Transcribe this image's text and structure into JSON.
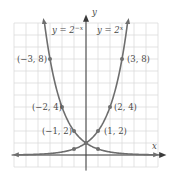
{
  "chart_data": {
    "type": "line",
    "title": "",
    "xlabel": "x",
    "ylabel": "y",
    "xlim": [
      -6,
      6
    ],
    "ylim": [
      -1,
      11
    ],
    "grid": true,
    "grid_step": 1,
    "series": [
      {
        "name": "y = 2^x",
        "label_main": "y = 2",
        "label_exp": "x",
        "function": "2^x",
        "points": [
          {
            "x": 1,
            "y": 2,
            "label": "(1, 2)"
          },
          {
            "x": 2,
            "y": 4,
            "label": "(2, 4)"
          },
          {
            "x": 3,
            "y": 8,
            "label": "(3, 8)"
          }
        ]
      },
      {
        "name": "y = 2^-x",
        "label_main": "y = 2",
        "label_exp": "−x",
        "function": "2^-x",
        "points": [
          {
            "x": -1,
            "y": 2,
            "label": "(−1, 2)"
          },
          {
            "x": -2,
            "y": 4,
            "label": "(−2, 4)"
          },
          {
            "x": -3,
            "y": 8,
            "label": "(−3, 8)"
          }
        ]
      }
    ],
    "intersection": {
      "x": 0,
      "y": 1
    },
    "extra_marked_points": [
      {
        "x": -1,
        "y": 0.5
      },
      {
        "x": 1,
        "y": 0.5
      }
    ]
  },
  "colors": {
    "curve": "#6e6e6e",
    "grid": "#dcdcdc",
    "axis": "#3a3a3a",
    "text": "#4a4a4a"
  }
}
